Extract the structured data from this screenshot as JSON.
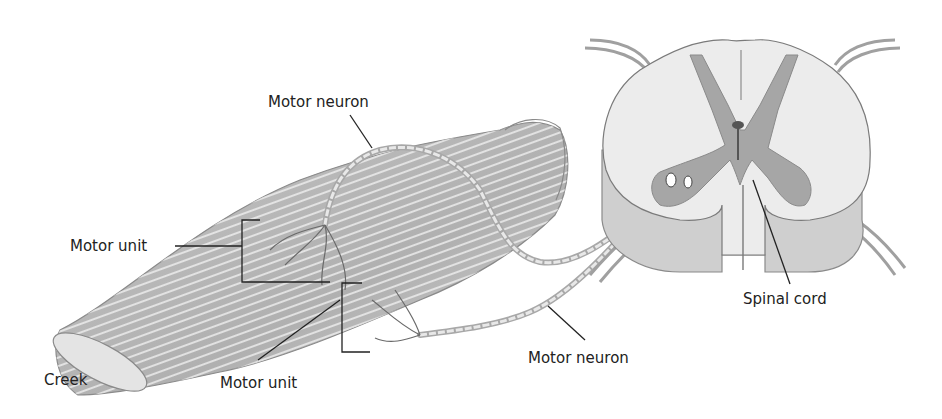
{
  "diagram": {
    "type": "anatomical illustration",
    "labels": {
      "motor_neuron_top": "Motor neuron",
      "motor_unit_left": "Motor unit",
      "motor_unit_bottom": "Motor unit",
      "motor_neuron_bottom": "Motor neuron",
      "spinal_cord": "Spinal cord",
      "creek": "Creek"
    },
    "colors": {
      "line": "#222222",
      "muscle_fill": "#d9d9d9",
      "muscle_stripe": "#9a9a9a",
      "gray_matter": "#9d9d9d",
      "white_matter": "#eeeeee",
      "nerve": "#bdbdbd"
    }
  }
}
